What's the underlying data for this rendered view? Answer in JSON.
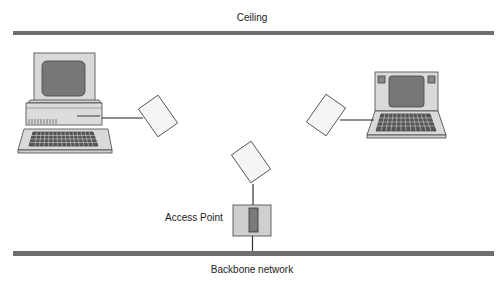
{
  "diagram": {
    "labels": {
      "ceiling": "Ceiling",
      "backbone": "Backbone network",
      "access_point": "Access Point"
    },
    "nodes": [
      {
        "id": "desktop",
        "type": "desktop-computer",
        "connected_to": "left-wireless-adapter"
      },
      {
        "id": "laptop",
        "type": "laptop-computer",
        "connected_to": "right-wireless-adapter"
      },
      {
        "id": "left-wireless-adapter",
        "type": "wireless-card"
      },
      {
        "id": "right-wireless-adapter",
        "type": "wireless-card"
      },
      {
        "id": "access-point-antenna",
        "type": "wireless-card"
      },
      {
        "id": "access-point",
        "type": "access-point",
        "connected_to": "backbone-network"
      }
    ],
    "colors": {
      "bar": "#6e6e6e",
      "device_fill": "#d6d6d6",
      "screen_fill": "#7a7a7a",
      "card_fill": "#f4f4f4",
      "stroke": "#333333"
    }
  }
}
